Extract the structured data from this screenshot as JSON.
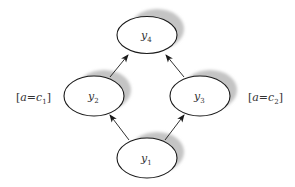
{
  "diagram": {
    "colors": {
      "stroke": "#1a1a1a",
      "shadow": "#c4c4c4",
      "fill": "#ffffff",
      "text": "#333333"
    },
    "nodes": [
      {
        "id": "y4",
        "var": "y",
        "sub": "4",
        "cx": 147,
        "cy": 35,
        "rx": 30,
        "ry": 18
      },
      {
        "id": "y2",
        "var": "y",
        "sub": "2",
        "cx": 94,
        "cy": 96,
        "rx": 30,
        "ry": 20
      },
      {
        "id": "y3",
        "var": "y",
        "sub": "3",
        "cx": 200,
        "cy": 96,
        "rx": 30,
        "ry": 20
      },
      {
        "id": "y1",
        "var": "y",
        "sub": "1",
        "cx": 147,
        "cy": 158,
        "rx": 30,
        "ry": 20
      }
    ],
    "edges": [
      {
        "from": "y1",
        "to": "y2"
      },
      {
        "from": "y1",
        "to": "y3"
      },
      {
        "from": "y2",
        "to": "y4"
      },
      {
        "from": "y3",
        "to": "y4"
      }
    ],
    "side_labels": [
      {
        "id": "left",
        "open": "[",
        "var": "a",
        "eq": "=",
        "cvar": "c",
        "sub": "1",
        "close": "]"
      },
      {
        "id": "right",
        "open": "[",
        "var": "a",
        "eq": "=",
        "cvar": "c",
        "sub": "2",
        "close": "]"
      }
    ]
  }
}
